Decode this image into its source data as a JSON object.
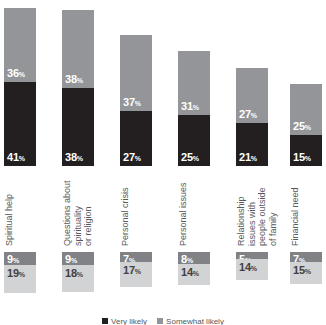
{
  "chart_data": {
    "type": "bar",
    "title": "",
    "subtitle": "",
    "xlabel": "",
    "ylabel": "",
    "grid": false,
    "stacked": true,
    "legend_position": "bottom",
    "legend_clipped": true,
    "categories": [
      "Spiritual help",
      "Questions about spirituality or religion",
      "Personal crisis",
      "Personal issues",
      "Relationship issues with people outside of family",
      "Financial need"
    ],
    "series": [
      {
        "name": "Very likely",
        "color": "#231f20",
        "values": [
          41,
          38,
          27,
          25,
          21,
          15
        ]
      },
      {
        "name": "Somewhat likely",
        "color": "#939598",
        "values": [
          36,
          38,
          37,
          31,
          27,
          25
        ]
      },
      {
        "name": "Not very likely",
        "color": "#808285",
        "values": [
          9,
          9,
          7,
          8,
          5,
          7
        ]
      },
      {
        "name": "Not at all likely",
        "color": "#d1d3d4",
        "values": [
          19,
          18,
          17,
          14,
          14,
          15
        ]
      }
    ],
    "upper_group_totals": [
      77,
      76,
      64,
      56,
      48,
      40
    ],
    "lower_group_totals": [
      28,
      27,
      24,
      22,
      19,
      22
    ],
    "value_suffix": "%"
  },
  "upper_bars": [
    {
      "label": "Spiritual help",
      "top": {
        "value": "36",
        "suffix": "%",
        "color": "#939598"
      },
      "bottom": {
        "value": "41",
        "suffix": "%",
        "color": "#231f20"
      }
    },
    {
      "label": "Questions about\nspirituality\nor religion",
      "top": {
        "value": "38",
        "suffix": "%",
        "color": "#939598"
      },
      "bottom": {
        "value": "38",
        "suffix": "%",
        "color": "#231f20"
      }
    },
    {
      "label": "Personal crisis",
      "top": {
        "value": "37",
        "suffix": "%",
        "color": "#939598"
      },
      "bottom": {
        "value": "27",
        "suffix": "%",
        "color": "#231f20"
      }
    },
    {
      "label": "Personal issues",
      "top": {
        "value": "31",
        "suffix": "%",
        "color": "#939598"
      },
      "bottom": {
        "value": "25",
        "suffix": "%",
        "color": "#231f20"
      }
    },
    {
      "label": "Relationship\nissues with\npeople outside\nof family",
      "top": {
        "value": "27",
        "suffix": "%",
        "color": "#939598"
      },
      "bottom": {
        "value": "21",
        "suffix": "%",
        "color": "#231f20"
      }
    },
    {
      "label": "Financial need",
      "top": {
        "value": "25",
        "suffix": "%",
        "color": "#939598"
      },
      "bottom": {
        "value": "15",
        "suffix": "%",
        "color": "#231f20"
      }
    }
  ],
  "lower_bars": [
    {
      "top": {
        "value": "9",
        "suffix": "%",
        "color": "#808285"
      },
      "bottom": {
        "value": "19",
        "suffix": "%",
        "color": "#d1d3d4"
      }
    },
    {
      "top": {
        "value": "9",
        "suffix": "%",
        "color": "#808285"
      },
      "bottom": {
        "value": "18",
        "suffix": "%",
        "color": "#d1d3d4"
      }
    },
    {
      "top": {
        "value": "7",
        "suffix": "%",
        "color": "#808285"
      },
      "bottom": {
        "value": "17",
        "suffix": "%",
        "color": "#d1d3d4"
      }
    },
    {
      "top": {
        "value": "8",
        "suffix": "%",
        "color": "#808285"
      },
      "bottom": {
        "value": "14",
        "suffix": "%",
        "color": "#d1d3d4"
      }
    },
    {
      "top": {
        "value": "5",
        "suffix": "%",
        "color": "#808285"
      },
      "bottom": {
        "value": "14",
        "suffix": "%",
        "color": "#d1d3d4"
      }
    },
    {
      "top": {
        "value": "7",
        "suffix": "%",
        "color": "#808285"
      },
      "bottom": {
        "value": "15",
        "suffix": "%",
        "color": "#d1d3d4"
      }
    }
  ],
  "legend": {
    "items": [
      {
        "label": "Very likely",
        "color": "#231f20"
      },
      {
        "label": "Somewhat likely",
        "color": "#939598"
      }
    ]
  },
  "geometry": {
    "bar_width": 32,
    "column_x": [
      4,
      62,
      120,
      178,
      236,
      290
    ],
    "upper_baseline_y": 166,
    "px_per_percent_upper": 2.05,
    "label_top_y": 176,
    "lower_top_y": 252,
    "px_per_percent_lower": 1.48
  },
  "colors": {
    "very_likely": "#231f20",
    "somewhat_likely": "#939598",
    "not_very_likely": "#808285",
    "not_at_all_likely": "#d1d3d4",
    "label_text": "#58595b",
    "background": "#ffffff"
  }
}
